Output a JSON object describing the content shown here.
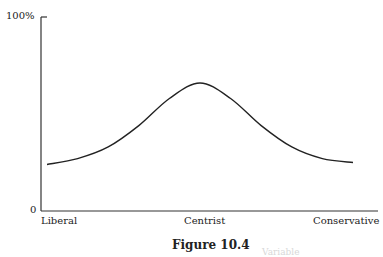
{
  "chart_data": {
    "type": "line",
    "title": "",
    "caption": "Figure 10.4",
    "xlabel": "",
    "ylabel": "",
    "ylim": [
      0,
      100
    ],
    "y_ticks": [
      "0",
      "100%"
    ],
    "categories": [
      "Liberal",
      "Centrist",
      "Conservative"
    ],
    "grid": false,
    "legend": null,
    "series": [
      {
        "name": "distribution",
        "x": [
          0,
          0.1,
          0.2,
          0.3,
          0.4,
          0.5,
          0.6,
          0.7,
          0.8,
          0.9,
          1.0
        ],
        "values": [
          24,
          27,
          33,
          44,
          58,
          66,
          58,
          44,
          33,
          27,
          25
        ]
      }
    ]
  },
  "labels": {
    "y_top": "100%",
    "y_bottom": "0",
    "x_left": "Liberal",
    "x_center": "Centrist",
    "x_right": "Conservative",
    "caption": "Figure 10.4",
    "ghost_text": "Variable"
  },
  "colors": {
    "axis": "#333333",
    "curve": "#222222"
  }
}
